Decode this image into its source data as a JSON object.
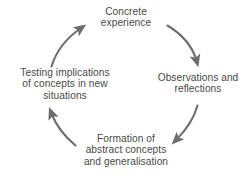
{
  "diagram": {
    "direction": "clockwise",
    "text_color": "#4a4a4a",
    "arrow_color": "#6e6e6e",
    "background_color": "#ffffff",
    "nodes": [
      {
        "id": "concrete-experience",
        "position": "top",
        "label": "Concrete\nexperience"
      },
      {
        "id": "observations-and-reflections",
        "position": "right",
        "label": "Observations and\nreflections"
      },
      {
        "id": "formation-of-abstract-concepts",
        "position": "bottom",
        "label": "Formation of\nabstract concepts\nand generalisation"
      },
      {
        "id": "testing-implications",
        "position": "left",
        "label": "Testing implications\nof concepts in new\nsituations"
      }
    ],
    "arrows": [
      {
        "id": "arrow-top-right",
        "from": "concrete-experience",
        "to": "observations-and-reflections"
      },
      {
        "id": "arrow-bottom-right",
        "from": "observations-and-reflections",
        "to": "formation-of-abstract-concepts"
      },
      {
        "id": "arrow-bottom-left",
        "from": "formation-of-abstract-concepts",
        "to": "testing-implications"
      },
      {
        "id": "arrow-top-left",
        "from": "testing-implications",
        "to": "concrete-experience"
      }
    ]
  }
}
